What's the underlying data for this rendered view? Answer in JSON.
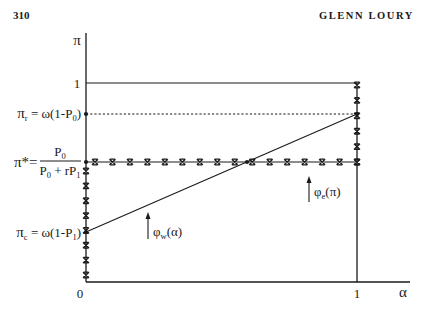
{
  "page": {
    "number": "310",
    "running_head": "GLENN LOURY"
  },
  "figure": {
    "y_axis_label": "π",
    "x_axis_label": "α",
    "y_tick_top": "1",
    "x_tick_origin": "0",
    "x_tick_right": "1",
    "pi_r": {
      "symbol": "π",
      "sub": "r",
      "rhs": " = ω(1-P",
      "rhs_sub": "0",
      "close": ")"
    },
    "pi_star": {
      "symbol": "π*=",
      "numerator": {
        "base": "P",
        "sub": "0"
      },
      "denominator": {
        "base": "P",
        "sub": "0",
        "mid": " + rP",
        "sub2": "1"
      }
    },
    "pi_c": {
      "symbol": "π",
      "sub": "c",
      "rhs": " = ω(1-P",
      "rhs_sub": "1",
      "close": ")"
    },
    "phi_w": {
      "symbol": "φ",
      "sub": "w",
      "arg": "(α)"
    },
    "phi_e": {
      "symbol": "φ",
      "sub": "e",
      "arg": "(π)"
    }
  }
}
